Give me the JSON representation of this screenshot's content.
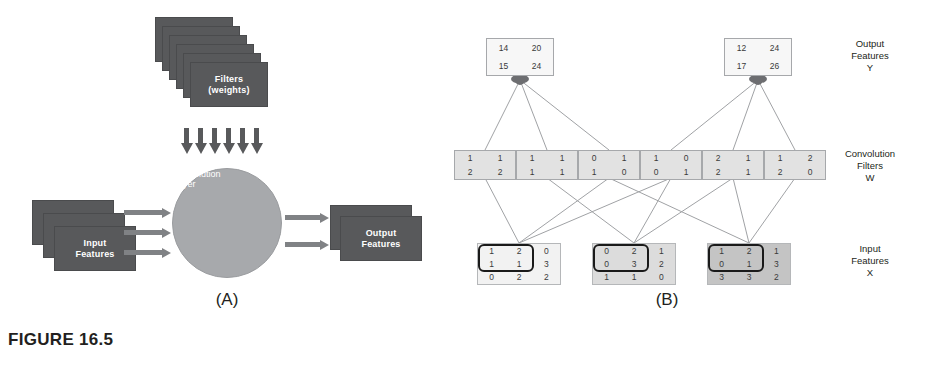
{
  "figure": {
    "caption": "FIGURE 16.5",
    "panel_a_letter": "(A)",
    "panel_b_letter": "(B)"
  },
  "panel_a": {
    "filters_label_line1": "Filters",
    "filters_label_line2": "(weights)",
    "filters_count": 6,
    "down_arrows_count": 6,
    "conv_label_line1": "Convolution",
    "conv_label_line2": "Layer",
    "input_label_line1": "Input",
    "input_label_line2": "Features",
    "input_count": 3,
    "input_arrows_count": 3,
    "output_label_line1": "Output",
    "output_label_line2": "Features",
    "output_count": 2,
    "output_arrows_count": 2,
    "colors": {
      "card": "#58595b",
      "circle": "#a7a9ac",
      "arrow": "#808285",
      "card_text": "#ffffff"
    }
  },
  "panel_b": {
    "labels": {
      "output": [
        "Output",
        "Features",
        "Y"
      ],
      "filters": [
        "Convolution",
        "Filters",
        "W"
      ],
      "inputs": [
        "Input",
        "Features",
        "X"
      ]
    },
    "outputs": [
      {
        "name": "Y1",
        "rows": [
          [
            "14",
            "20"
          ],
          [
            "15",
            "24"
          ]
        ]
      },
      {
        "name": "Y2",
        "rows": [
          [
            "12",
            "24"
          ],
          [
            "17",
            "26"
          ]
        ]
      }
    ],
    "filters": [
      {
        "name": "W11",
        "rows": [
          [
            "1",
            "1"
          ],
          [
            "2",
            "2"
          ]
        ]
      },
      {
        "name": "W12",
        "rows": [
          [
            "1",
            "1"
          ],
          [
            "1",
            "1"
          ]
        ]
      },
      {
        "name": "W13",
        "rows": [
          [
            "0",
            "1"
          ],
          [
            "1",
            "0"
          ]
        ]
      },
      {
        "name": "W21",
        "rows": [
          [
            "1",
            "0"
          ],
          [
            "0",
            "1"
          ]
        ]
      },
      {
        "name": "W22",
        "rows": [
          [
            "2",
            "1"
          ],
          [
            "2",
            "1"
          ]
        ]
      },
      {
        "name": "W23",
        "rows": [
          [
            "1",
            "2"
          ],
          [
            "2",
            "0"
          ]
        ]
      }
    ],
    "inputs": [
      {
        "name": "X1",
        "shade": "#f2f2f2",
        "rows": [
          [
            "1",
            "2",
            "0"
          ],
          [
            "1",
            "1",
            "3"
          ],
          [
            "0",
            "2",
            "2"
          ]
        ]
      },
      {
        "name": "X2",
        "shade": "#dcdcdc",
        "rows": [
          [
            "0",
            "2",
            "1"
          ],
          [
            "0",
            "3",
            "2"
          ],
          [
            "1",
            "1",
            "0"
          ]
        ]
      },
      {
        "name": "X3",
        "shade": "#c4c4c4",
        "rows": [
          [
            "1",
            "2",
            "1"
          ],
          [
            "0",
            "1",
            "3"
          ],
          [
            "3",
            "3",
            "2"
          ]
        ]
      }
    ],
    "colors": {
      "edge": "#a0a2a5",
      "node": "#6d6e71",
      "kernel_outline": "#1a1a1a"
    }
  }
}
